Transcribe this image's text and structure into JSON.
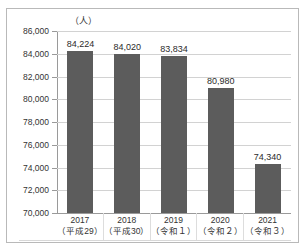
{
  "figure": {
    "unit_label": "（人）",
    "border_color": "#b9b9b9",
    "background": "#ffffff"
  },
  "chart_data": {
    "type": "bar",
    "title": "",
    "subtitle": "",
    "xlabel": "",
    "ylabel": "（人）",
    "ylim": [
      70000,
      86000
    ],
    "ytick_step": 2000,
    "grid": true,
    "legend": "none",
    "bar_color": "#5c5c5c",
    "categories": [
      "2017\n（平成29）",
      "2018\n（平成30）",
      "2019\n（令和１）",
      "2020\n（令和２）",
      "2021\n（令和３）"
    ],
    "category_years": [
      "2017",
      "2018",
      "2019",
      "2020",
      "2021"
    ],
    "category_eras": [
      "（平成29）",
      "（平成30）",
      "（令和１）",
      "（令和２）",
      "（令和３）"
    ],
    "values": [
      84224,
      84020,
      83834,
      80980,
      74340
    ],
    "value_labels": [
      "84,224",
      "84,020",
      "83,834",
      "80,980",
      "74,340"
    ],
    "ytick_values": [
      86000,
      84000,
      82000,
      80000,
      78000,
      76000,
      74000,
      72000,
      70000
    ],
    "ytick_labels": [
      "86,000",
      "84,000",
      "82,000",
      "80,000",
      "78,000",
      "76,000",
      "74,000",
      "72,000",
      "70,000"
    ]
  }
}
